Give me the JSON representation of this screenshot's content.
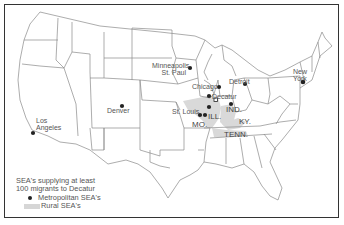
{
  "map": {
    "title": "SEA's supplying at least 100 migrants to Decatur",
    "destination": "Decatur",
    "legend": {
      "title_line1": "SEA's supplying at least",
      "title_line2": "100 migrants to Decatur",
      "metropolitan_label": "Metropolitan SEA's",
      "rural_label": "Rural SEA's"
    },
    "colors": {
      "metropolitan_dot": "#222222",
      "rural_fill": "#d6d6d6",
      "state_lines": "#888888",
      "frame": "#333333"
    },
    "cities": [
      {
        "name": "Los Angeles",
        "line1": "Los",
        "line2": "Angeles"
      },
      {
        "name": "Denver",
        "line1": "Denver"
      },
      {
        "name": "Minneapolis-St. Paul",
        "line1": "Minneapolis",
        "line2": "St. Paul"
      },
      {
        "name": "Chicago",
        "line1": "Chicago"
      },
      {
        "name": "Detroit",
        "line1": "Detroit"
      },
      {
        "name": "Decatur",
        "line1": "Decatur"
      },
      {
        "name": "St. Louis",
        "line1": "St. Louis"
      },
      {
        "name": "New York",
        "line1": "New",
        "line2": "York"
      }
    ],
    "states": {
      "ill": "ILL.",
      "ind": "IND.",
      "mo": "MO.",
      "ky": "KY.",
      "tenn": "TENN."
    }
  }
}
